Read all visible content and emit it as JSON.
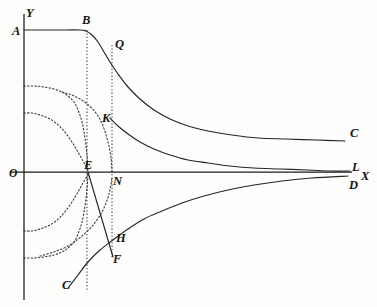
{
  "figure": {
    "type": "line",
    "background_color": "#fdfdfc",
    "stroke_color": "#252525",
    "axis_color": "#1c1c1c"
  },
  "axes": {
    "y_axis_label": "Y",
    "x_axis_label": "X",
    "origin_label": "O",
    "y_axis_x_px": 24,
    "x_axis_y_px": 172,
    "x_axis_start_px": 10,
    "x_axis_end_px": 352,
    "y_axis_top_px": 14,
    "y_axis_bottom_px": 300
  },
  "labels": [
    {
      "id": "Y",
      "text": "Y",
      "x": 26,
      "y": 17,
      "role": "axis-name"
    },
    {
      "id": "A",
      "text": "A",
      "x": 12,
      "y": 35,
      "role": "point"
    },
    {
      "id": "B",
      "text": "B",
      "x": 82,
      "y": 24,
      "role": "point"
    },
    {
      "id": "Q",
      "text": "Q",
      "x": 115,
      "y": 48,
      "role": "point"
    },
    {
      "id": "C1",
      "text": "C",
      "x": 350,
      "y": 137,
      "role": "point"
    },
    {
      "id": "K",
      "text": "K",
      "x": 102,
      "y": 122,
      "role": "point"
    },
    {
      "id": "O",
      "text": "O",
      "x": 9,
      "y": 177,
      "role": "origin"
    },
    {
      "id": "E",
      "text": "E",
      "x": 84,
      "y": 169,
      "role": "point"
    },
    {
      "id": "N",
      "text": "N",
      "x": 113,
      "y": 185,
      "role": "point"
    },
    {
      "id": "L",
      "text": "L",
      "x": 352,
      "y": 171,
      "role": "point"
    },
    {
      "id": "X",
      "text": "X",
      "x": 361,
      "y": 180,
      "role": "axis-name"
    },
    {
      "id": "D",
      "text": "D",
      "x": 349,
      "y": 189,
      "role": "point"
    },
    {
      "id": "H",
      "text": "H",
      "x": 116,
      "y": 242,
      "role": "point"
    },
    {
      "id": "F",
      "text": "F",
      "x": 113,
      "y": 263,
      "role": "point"
    },
    {
      "id": "C2",
      "text": "C",
      "x": 62,
      "y": 289,
      "role": "point"
    }
  ],
  "chart_data": {
    "type": "line",
    "xlabel": "X",
    "ylabel": "Y",
    "grid": false,
    "legend": false,
    "axis_origin_px": {
      "x": 24,
      "y": 172
    },
    "series": [
      {
        "name": "ABQC",
        "style": "solid",
        "description": "Flat top from A through B, descends through Q, asymptotic to X axis at C",
        "points_px": [
          [
            24,
            30
          ],
          [
            56,
            30
          ],
          [
            80,
            30
          ],
          [
            86,
            31
          ],
          [
            92,
            35
          ],
          [
            98,
            42
          ],
          [
            104,
            52
          ],
          [
            110,
            62
          ],
          [
            118,
            74
          ],
          [
            128,
            87
          ],
          [
            140,
            99
          ],
          [
            154,
            110
          ],
          [
            170,
            119
          ],
          [
            188,
            126
          ],
          [
            208,
            131
          ],
          [
            232,
            135
          ],
          [
            258,
            138
          ],
          [
            286,
            139
          ],
          [
            316,
            140
          ],
          [
            345,
            141
          ]
        ]
      },
      {
        "name": "KL-upper",
        "style": "solid",
        "description": "Branch from K descending asymptotically to X axis near L",
        "points_px": [
          [
            110,
            118
          ],
          [
            118,
            126
          ],
          [
            128,
            134
          ],
          [
            140,
            142
          ],
          [
            154,
            149
          ],
          [
            170,
            155
          ],
          [
            188,
            160
          ],
          [
            208,
            163
          ],
          [
            230,
            166
          ],
          [
            254,
            168
          ],
          [
            280,
            169
          ],
          [
            308,
            170
          ],
          [
            330,
            171
          ],
          [
            350,
            171
          ]
        ]
      },
      {
        "name": "EF-line",
        "style": "solid",
        "description": "Straight segment from E on the X axis down to F",
        "points_px": [
          [
            88,
            172
          ],
          [
            113,
            257
          ]
        ]
      },
      {
        "name": "CHD-lower",
        "style": "solid",
        "description": "Branch rising from C at lower left through H toward D, asymptotic to X axis",
        "points_px": [
          [
            68,
            288
          ],
          [
            78,
            275
          ],
          [
            88,
            262
          ],
          [
            100,
            250
          ],
          [
            113,
            240
          ],
          [
            128,
            229
          ],
          [
            144,
            219
          ],
          [
            162,
            211
          ],
          [
            182,
            203
          ],
          [
            204,
            196
          ],
          [
            228,
            190
          ],
          [
            254,
            185
          ],
          [
            282,
            181
          ],
          [
            312,
            178
          ],
          [
            348,
            176
          ]
        ]
      },
      {
        "name": "asymptote-outer-upper",
        "style": "dotted",
        "description": "Outer dotted branch from Y axis curving down to vertical asymptote at E",
        "points_px": [
          [
            24,
            86
          ],
          [
            34,
            86
          ],
          [
            44,
            87
          ],
          [
            54,
            89
          ],
          [
            62,
            92
          ],
          [
            68,
            96
          ],
          [
            74,
            102
          ],
          [
            78,
            110
          ],
          [
            82,
            122
          ],
          [
            85,
            138
          ],
          [
            87,
            155
          ],
          [
            88,
            170
          ]
        ]
      },
      {
        "name": "asymptote-inner-upper",
        "style": "dotted",
        "description": "Inner dotted branch from Y axis curving down to vertical asymptote at E",
        "points_px": [
          [
            24,
            113
          ],
          [
            32,
            113
          ],
          [
            40,
            115
          ],
          [
            48,
            118
          ],
          [
            56,
            123
          ],
          [
            64,
            131
          ],
          [
            72,
            142
          ],
          [
            78,
            152
          ],
          [
            83,
            161
          ],
          [
            87,
            168
          ],
          [
            88,
            172
          ]
        ]
      },
      {
        "name": "asymptote-outer-lower",
        "style": "dotted",
        "description": "Mirror of outer dotted branch below the X axis",
        "points_px": [
          [
            24,
            258
          ],
          [
            34,
            258
          ],
          [
            44,
            257
          ],
          [
            54,
            255
          ],
          [
            62,
            252
          ],
          [
            68,
            248
          ],
          [
            74,
            242
          ],
          [
            78,
            234
          ],
          [
            82,
            222
          ],
          [
            85,
            206
          ],
          [
            87,
            189
          ],
          [
            88,
            174
          ]
        ]
      },
      {
        "name": "asymptote-inner-lower",
        "style": "dotted",
        "description": "Mirror of inner dotted branch below the X axis",
        "points_px": [
          [
            24,
            231
          ],
          [
            32,
            231
          ],
          [
            40,
            229
          ],
          [
            48,
            226
          ],
          [
            56,
            221
          ],
          [
            64,
            213
          ],
          [
            72,
            202
          ],
          [
            78,
            192
          ],
          [
            83,
            183
          ],
          [
            87,
            176
          ],
          [
            88,
            172
          ]
        ]
      },
      {
        "name": "asymptote-N-upper",
        "style": "dotted",
        "description": "Dotted branch descending to the vertical asymptote through N, above the axis",
        "points_px": [
          [
            62,
            92
          ],
          [
            74,
            96
          ],
          [
            86,
            103
          ],
          [
            96,
            113
          ],
          [
            103,
            126
          ],
          [
            108,
            142
          ],
          [
            111,
            158
          ],
          [
            112,
            171
          ]
        ]
      },
      {
        "name": "asymptote-N-lower",
        "style": "dotted",
        "description": "Dotted branch rising from below toward the vertical asymptote through N",
        "points_px": [
          [
            40,
            256
          ],
          [
            54,
            252
          ],
          [
            68,
            246
          ],
          [
            82,
            236
          ],
          [
            94,
            224
          ],
          [
            103,
            210
          ],
          [
            109,
            194
          ],
          [
            112,
            178
          ]
        ]
      }
    ],
    "vertical_dotted_lines": [
      {
        "name": "B-to-E",
        "x_px": 87,
        "y_top_px": 30,
        "y_bottom_px": 290
      },
      {
        "name": "Q-to-F",
        "x_px": 112,
        "y_top_px": 45,
        "y_bottom_px": 258
      }
    ]
  }
}
